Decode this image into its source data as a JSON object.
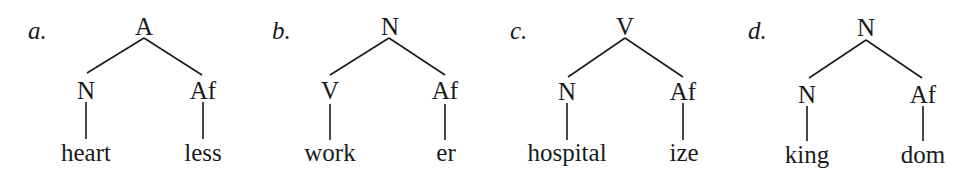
{
  "trees": [
    {
      "label": "a.",
      "root": "A",
      "left": {
        "cat": "N",
        "word": "heart"
      },
      "right": {
        "cat": "Af",
        "word": "less"
      }
    },
    {
      "label": "b.",
      "root": "N",
      "left": {
        "cat": "V",
        "word": "work"
      },
      "right": {
        "cat": "Af",
        "word": "er"
      }
    },
    {
      "label": "c.",
      "root": "V",
      "left": {
        "cat": "N",
        "word": "hospital"
      },
      "right": {
        "cat": "Af",
        "word": "ize"
      }
    },
    {
      "label": "d.",
      "root": "N",
      "left": {
        "cat": "N",
        "word": "king"
      },
      "right": {
        "cat": "Af",
        "word": "dom"
      }
    }
  ]
}
